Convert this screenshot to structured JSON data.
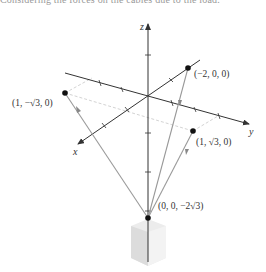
{
  "caption": "Considering the forces on the cables due to the load.",
  "axes": {
    "x_label": "x",
    "y_label": "y",
    "z_label": "z"
  },
  "points": [
    {
      "id": "p1",
      "label": "(1, −√3, 0)"
    },
    {
      "id": "p2",
      "label": "(−2, 0, 0)"
    },
    {
      "id": "p3",
      "label": "(1, √3, 0)"
    },
    {
      "id": "p4",
      "label": "(0, 0, −2√3)"
    }
  ],
  "colors": {
    "axis": "#333333",
    "cable": "#9a9a9a",
    "dashed": "#c8c8c8",
    "point": "#111111",
    "load": "#e6e6e6"
  }
}
